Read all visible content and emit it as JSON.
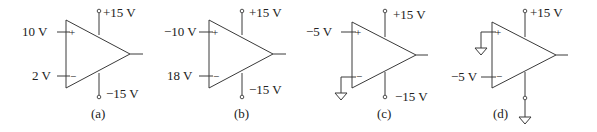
{
  "circuits": [
    {
      "id": "a",
      "caption": "(a)",
      "noninverting_input": "10 V",
      "inverting_input": "2 V",
      "plus_sign": "+",
      "minus_sign": "−",
      "positive_supply": "+15 V",
      "negative_supply": "−15 V"
    },
    {
      "id": "b",
      "caption": "(b)",
      "noninverting_input": "−10 V",
      "inverting_input": "18 V",
      "plus_sign": "+",
      "minus_sign": "−",
      "positive_supply": "+15 V",
      "negative_supply": "−15 V"
    },
    {
      "id": "c",
      "caption": "(c)",
      "noninverting_input": "−5 V",
      "inverting_input": "ground",
      "plus_sign": "+",
      "minus_sign": "−",
      "positive_supply": "+15 V",
      "negative_supply": "−15 V"
    },
    {
      "id": "d",
      "caption": "(d)",
      "noninverting_input": "ground",
      "inverting_input": "−5 V",
      "plus_sign": "+",
      "minus_sign": "−",
      "positive_supply": "+15 V",
      "negative_supply": "ground"
    }
  ]
}
